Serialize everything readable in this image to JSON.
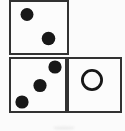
{
  "figure": {
    "background_color": "#fbfbfb",
    "tile_fill_color": "#fdfdfd",
    "line_color": "#2a2a2a",
    "pip_color": "#181818",
    "canvas": {
      "width": 125,
      "height": 131
    },
    "tiles": [
      {
        "name": "top-left-tile",
        "x": 10,
        "y": 1,
        "w": 58,
        "h": 53,
        "pip_type": "filled",
        "pip_count": 2,
        "pips": [
          {
            "cx": 27,
            "cy": 14.5,
            "r": 6.5
          },
          {
            "cx": 48.5,
            "cy": 38.5,
            "r": 6.8
          }
        ]
      },
      {
        "name": "bottom-left-tile",
        "x": 10,
        "y": 58,
        "w": 56,
        "h": 54,
        "pip_type": "filled",
        "pip_count": 3,
        "pips": [
          {
            "cx": 55,
            "cy": 67,
            "r": 6.6
          },
          {
            "cx": 40,
            "cy": 85.5,
            "r": 6.6
          },
          {
            "cx": 22,
            "cy": 102,
            "r": 6.6
          }
        ]
      },
      {
        "name": "bottom-right-tile",
        "x": 68,
        "y": 58,
        "w": 53,
        "h": 54,
        "pip_type": "outline",
        "pip_count": 1,
        "pips": [
          {
            "cx": 92,
            "cy": 80,
            "r": 9.6,
            "stroke_width": 2.8
          }
        ]
      }
    ],
    "smudge": {
      "cx": 64,
      "cy": 128,
      "rx": 11,
      "ry": 1.6,
      "color": "#ececec"
    }
  }
}
